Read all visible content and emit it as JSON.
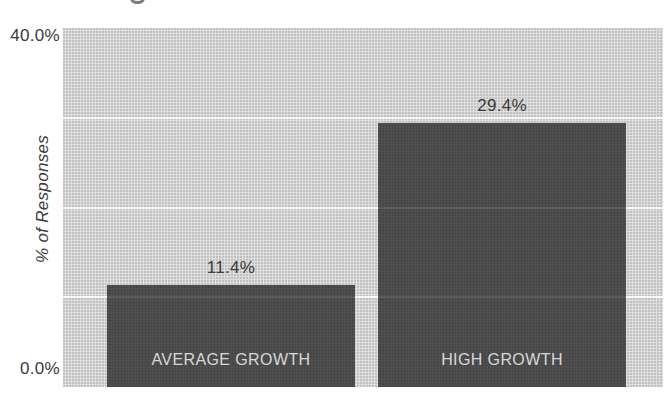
{
  "chart_data": {
    "type": "bar",
    "categories": [
      "AVERAGE GROWTH",
      "HIGH GROWTH"
    ],
    "values": [
      11.4,
      29.4
    ],
    "value_labels": [
      "11.4%",
      "29.4%"
    ],
    "title": "",
    "xlabel": "",
    "ylabel": "% of Responses",
    "ytick_labels": [
      "40.0%",
      "0.0%"
    ],
    "ylim": [
      0,
      40
    ],
    "gridline_values": [
      10,
      20,
      30
    ],
    "grid": "horizontal white gridlines every 10%",
    "legend": "none",
    "colors": {
      "page_background": "#ffffff",
      "plot_background": "#d9d9d9",
      "bar_fill": "#474747",
      "gridline": "#fafafa",
      "value_label_text": "#3b3b3b",
      "category_label_text": "#d8d8d8",
      "axis_text": "#3b3b3b"
    }
  }
}
